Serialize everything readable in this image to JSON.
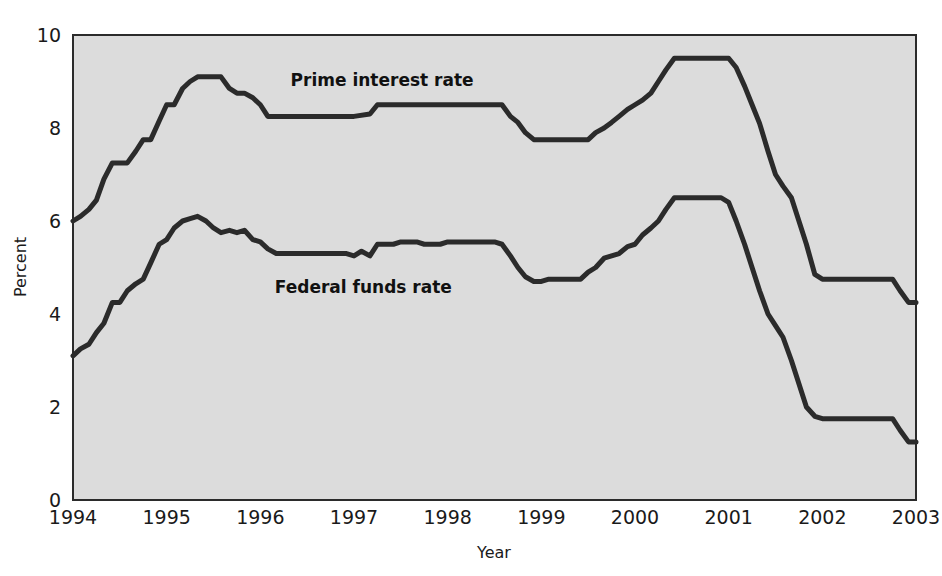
{
  "chart_data": {
    "type": "line",
    "title": "",
    "xlabel": "Year",
    "ylabel": "Percent",
    "xlim": [
      1994.0,
      2003.0
    ],
    "ylim": [
      0,
      10
    ],
    "grid": false,
    "legend_position": "inline-annotation",
    "x_tick_labels": [
      "1994",
      "1995",
      "1996",
      "1997",
      "1998",
      "1999",
      "2000",
      "2001",
      "2002",
      "2003"
    ],
    "x_tick_values": [
      1994,
      1995,
      1996,
      1997,
      1998,
      1999,
      2000,
      2001,
      2002,
      2003
    ],
    "y_tick_labels": [
      "0",
      "2",
      "4",
      "6",
      "8",
      "10"
    ],
    "y_tick_values": [
      0,
      2,
      4,
      6,
      8,
      10
    ],
    "annotations": [
      {
        "text": "Prime interest rate",
        "x": 1997.3,
        "y": 8.9
      },
      {
        "text": "Federal funds rate",
        "x": 1997.1,
        "y": 4.45
      }
    ],
    "series": [
      {
        "name": "Prime interest rate",
        "color": "#2b2b2b",
        "x": [
          1994.0,
          1994.08,
          1994.17,
          1994.25,
          1994.33,
          1994.42,
          1994.5,
          1994.58,
          1994.67,
          1994.75,
          1994.83,
          1994.92,
          1995.0,
          1995.08,
          1995.17,
          1995.25,
          1995.33,
          1995.42,
          1995.5,
          1995.58,
          1995.67,
          1995.75,
          1995.83,
          1995.92,
          1996.0,
          1996.08,
          1996.17,
          1996.25,
          1996.33,
          1996.42,
          1996.5,
          1996.58,
          1996.67,
          1996.75,
          1996.83,
          1996.92,
          1997.0,
          1997.17,
          1997.25,
          1997.33,
          1997.5,
          1997.75,
          1998.0,
          1998.25,
          1998.5,
          1998.58,
          1998.67,
          1998.75,
          1998.83,
          1998.92,
          1999.0,
          1999.25,
          1999.5,
          1999.58,
          1999.67,
          1999.75,
          1999.83,
          1999.92,
          2000.0,
          2000.08,
          2000.17,
          2000.25,
          2000.33,
          2000.42,
          2000.5,
          2000.58,
          2000.67,
          2000.75,
          2000.83,
          2000.92,
          2001.0,
          2001.08,
          2001.17,
          2001.25,
          2001.33,
          2001.42,
          2001.5,
          2001.58,
          2001.67,
          2001.75,
          2001.83,
          2001.92,
          2002.0,
          2002.25,
          2002.5,
          2002.67,
          2002.75,
          2002.83,
          2002.92,
          2003.0
        ],
        "y": [
          6.0,
          6.1,
          6.25,
          6.45,
          6.9,
          7.25,
          7.25,
          7.25,
          7.5,
          7.75,
          7.75,
          8.15,
          8.5,
          8.5,
          8.85,
          9.0,
          9.1,
          9.1,
          9.1,
          9.1,
          8.85,
          8.75,
          8.75,
          8.65,
          8.5,
          8.25,
          8.25,
          8.25,
          8.25,
          8.25,
          8.25,
          8.25,
          8.25,
          8.25,
          8.25,
          8.25,
          8.25,
          8.3,
          8.5,
          8.5,
          8.5,
          8.5,
          8.5,
          8.5,
          8.5,
          8.5,
          8.25,
          8.12,
          7.9,
          7.75,
          7.75,
          7.75,
          7.75,
          7.9,
          8.0,
          8.12,
          8.25,
          8.4,
          8.5,
          8.6,
          8.75,
          9.0,
          9.25,
          9.5,
          9.5,
          9.5,
          9.5,
          9.5,
          9.5,
          9.5,
          9.5,
          9.3,
          8.9,
          8.5,
          8.1,
          7.5,
          7.0,
          6.75,
          6.5,
          6.0,
          5.5,
          4.85,
          4.75,
          4.75,
          4.75,
          4.75,
          4.75,
          4.5,
          4.25,
          4.25
        ]
      },
      {
        "name": "Federal funds rate",
        "color": "#2b2b2b",
        "x": [
          1994.0,
          1994.08,
          1994.17,
          1994.25,
          1994.33,
          1994.42,
          1994.5,
          1994.58,
          1994.67,
          1994.75,
          1994.83,
          1994.92,
          1995.0,
          1995.08,
          1995.17,
          1995.25,
          1995.33,
          1995.42,
          1995.5,
          1995.58,
          1995.67,
          1995.75,
          1995.83,
          1995.92,
          1996.0,
          1996.08,
          1996.17,
          1996.25,
          1996.33,
          1996.42,
          1996.5,
          1996.58,
          1996.67,
          1996.75,
          1996.83,
          1996.92,
          1997.0,
          1997.08,
          1997.17,
          1997.25,
          1997.33,
          1997.42,
          1997.5,
          1997.58,
          1997.67,
          1997.75,
          1997.83,
          1997.92,
          1998.0,
          1998.17,
          1998.33,
          1998.5,
          1998.58,
          1998.67,
          1998.75,
          1998.83,
          1998.92,
          1999.0,
          1999.08,
          1999.17,
          1999.25,
          1999.33,
          1999.42,
          1999.5,
          1999.58,
          1999.67,
          1999.75,
          1999.83,
          1999.92,
          2000.0,
          2000.08,
          2000.17,
          2000.25,
          2000.33,
          2000.42,
          2000.5,
          2000.58,
          2000.67,
          2000.75,
          2000.83,
          2000.92,
          2001.0,
          2001.08,
          2001.17,
          2001.25,
          2001.33,
          2001.42,
          2001.5,
          2001.58,
          2001.67,
          2001.75,
          2001.83,
          2001.92,
          2002.0,
          2002.25,
          2002.5,
          2002.67,
          2002.75,
          2002.83,
          2002.92,
          2003.0
        ],
        "y": [
          3.1,
          3.25,
          3.35,
          3.6,
          3.8,
          4.25,
          4.25,
          4.5,
          4.65,
          4.75,
          5.1,
          5.5,
          5.6,
          5.85,
          6.0,
          6.05,
          6.1,
          6.0,
          5.85,
          5.75,
          5.8,
          5.75,
          5.8,
          5.6,
          5.55,
          5.4,
          5.3,
          5.3,
          5.3,
          5.3,
          5.3,
          5.3,
          5.3,
          5.3,
          5.3,
          5.3,
          5.25,
          5.35,
          5.25,
          5.5,
          5.5,
          5.5,
          5.55,
          5.55,
          5.55,
          5.5,
          5.5,
          5.5,
          5.55,
          5.55,
          5.55,
          5.55,
          5.5,
          5.25,
          5.0,
          4.8,
          4.7,
          4.7,
          4.75,
          4.75,
          4.75,
          4.75,
          4.75,
          4.9,
          5.0,
          5.2,
          5.25,
          5.3,
          5.45,
          5.5,
          5.7,
          5.85,
          6.0,
          6.25,
          6.5,
          6.5,
          6.5,
          6.5,
          6.5,
          6.5,
          6.5,
          6.4,
          6.0,
          5.5,
          5.0,
          4.5,
          4.0,
          3.75,
          3.5,
          3.0,
          2.5,
          2.0,
          1.8,
          1.75,
          1.75,
          1.75,
          1.75,
          1.75,
          1.5,
          1.25,
          1.25
        ]
      }
    ]
  }
}
